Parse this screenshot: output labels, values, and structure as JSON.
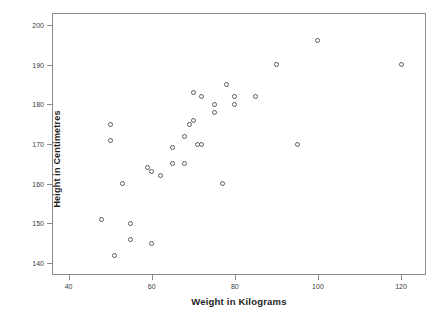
{
  "chart_data": {
    "type": "scatter",
    "title": "",
    "xlabel": "Weight in Kilograms",
    "ylabel": "Height in Centimetres",
    "xlim": [
      36,
      126
    ],
    "ylim": [
      137,
      203
    ],
    "xticks": [
      40,
      60,
      80,
      100,
      120
    ],
    "yticks": [
      140,
      150,
      160,
      170,
      180,
      190,
      200
    ],
    "grid": false,
    "legend": null,
    "marker": {
      "shape": "open-circle",
      "color": "#5a5a66",
      "size": 5
    },
    "frame_color": "#8c8c8c",
    "points": [
      {
        "x": 48,
        "y": 151
      },
      {
        "x": 50,
        "y": 175
      },
      {
        "x": 50,
        "y": 171
      },
      {
        "x": 51,
        "y": 142
      },
      {
        "x": 53,
        "y": 160
      },
      {
        "x": 55,
        "y": 150
      },
      {
        "x": 55,
        "y": 146
      },
      {
        "x": 59,
        "y": 164
      },
      {
        "x": 60,
        "y": 163
      },
      {
        "x": 60,
        "y": 145
      },
      {
        "x": 62,
        "y": 162
      },
      {
        "x": 65,
        "y": 169
      },
      {
        "x": 65,
        "y": 165
      },
      {
        "x": 68,
        "y": 172
      },
      {
        "x": 68,
        "y": 165
      },
      {
        "x": 69,
        "y": 175
      },
      {
        "x": 70,
        "y": 183
      },
      {
        "x": 70,
        "y": 176
      },
      {
        "x": 71,
        "y": 170
      },
      {
        "x": 72,
        "y": 182
      },
      {
        "x": 72,
        "y": 170
      },
      {
        "x": 75,
        "y": 180
      },
      {
        "x": 75,
        "y": 178
      },
      {
        "x": 77,
        "y": 160
      },
      {
        "x": 78,
        "y": 185
      },
      {
        "x": 80,
        "y": 182
      },
      {
        "x": 80,
        "y": 180
      },
      {
        "x": 85,
        "y": 182
      },
      {
        "x": 90,
        "y": 190
      },
      {
        "x": 95,
        "y": 170
      },
      {
        "x": 100,
        "y": 196
      },
      {
        "x": 120,
        "y": 190
      }
    ]
  }
}
